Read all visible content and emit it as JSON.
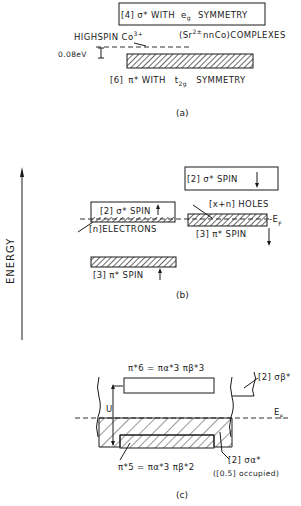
{
  "figure": {
    "axis_label": "ENERGY",
    "panels": {
      "a": {
        "caption": "(a)",
        "upper_band": {
          "count": "[4]",
          "label": "σ* WITH",
          "sub_sym": "e",
          "sub_idx": "g",
          "tail": "SYMMETRY"
        },
        "high_spin_label": "HIGHSPIN Co",
        "high_spin_sup": "3+",
        "complexes_label": "(Sr",
        "complexes_sup": "2±",
        "complexes_tail": "nnCo)COMPLEXES",
        "gap_label": "0.08eV",
        "lower_band": {
          "count": "[6]",
          "label": "π* WITH",
          "sub_sym": "t",
          "sub_idx": "2g",
          "tail": "SYMMETRY"
        }
      },
      "b": {
        "caption": "(b)",
        "sigma_down": "[2] σ* SPIN",
        "sigma_up": "[2] σ* SPIN",
        "electrons": "[n]ELECTRONS",
        "holes": "[x+n] HOLES",
        "fermi": "-E",
        "fermi_sub": "F",
        "pi_down": "[3] π* SPIN",
        "pi_up": "[3] π* SPIN"
      },
      "c": {
        "caption": "(c)",
        "upper_eq": "π*6 = πα*3 πβ*3",
        "lower_eq": "π*5 = πα*3 πβ*2",
        "u_label": "U",
        "fermi": "E",
        "fermi_sub": "F",
        "sigma_beta": "[2] σβ*",
        "sigma_alpha": "[2] σα*",
        "occupied": "([0.5] occupied)"
      }
    }
  }
}
